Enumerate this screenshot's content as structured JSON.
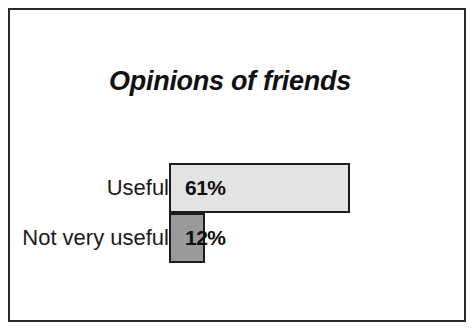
{
  "chart_data": {
    "type": "bar",
    "orientation": "horizontal",
    "title": "Opinions of friends",
    "categories": [
      "Useful",
      "Not very useful"
    ],
    "values": [
      61,
      12
    ],
    "value_labels": [
      "61%",
      "12%"
    ],
    "xlabel": "",
    "ylabel": "",
    "xlim": [
      0,
      100
    ],
    "grid": false,
    "legend": null,
    "unit": "%",
    "series": [
      {
        "name": "Opinions of friends",
        "values": [
          61,
          12
        ],
        "labels": [
          "61%",
          "12%"
        ],
        "colors": [
          "#e3e3e3",
          "#9a9a9a"
        ]
      }
    ],
    "colors": {
      "bar_useful": "#e3e3e3",
      "bar_not_very_useful": "#9a9a9a",
      "bar_border": "#1c1c1c",
      "frame_border": "#2a2a2a",
      "background": "#ffffff",
      "text": "#111111"
    }
  }
}
